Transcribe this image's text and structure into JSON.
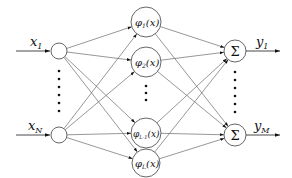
{
  "diagram": {
    "type": "rbf-neural-network",
    "input_layer": {
      "nodes": [
        {
          "id": "x1",
          "label": "x",
          "subscript": "1"
        },
        {
          "id": "xN",
          "label": "x",
          "subscript": "N"
        }
      ],
      "ellipsis": "vertical-dots"
    },
    "hidden_layer": {
      "nodes": [
        {
          "id": "phi1",
          "symbol": "φ",
          "subscript": "1",
          "arg": "(x)"
        },
        {
          "id": "phi2",
          "symbol": "φ",
          "subscript": "2",
          "arg": "(x)"
        },
        {
          "id": "phiL-1",
          "symbol": "φ",
          "subscript": "L-1",
          "arg": "(x)"
        },
        {
          "id": "phiL",
          "symbol": "φ",
          "subscript": "L",
          "arg": "(x)"
        }
      ],
      "ellipsis": "vertical-dots"
    },
    "output_layer": {
      "nodes": [
        {
          "id": "sum1",
          "symbol": "Σ",
          "output_label": "y",
          "output_subscript": "1"
        },
        {
          "id": "sumM",
          "symbol": "Σ",
          "output_label": "y",
          "output_subscript": "M"
        }
      ],
      "ellipsis": "vertical-dots"
    },
    "connections": "fully-connected input→hidden, hidden→output"
  }
}
